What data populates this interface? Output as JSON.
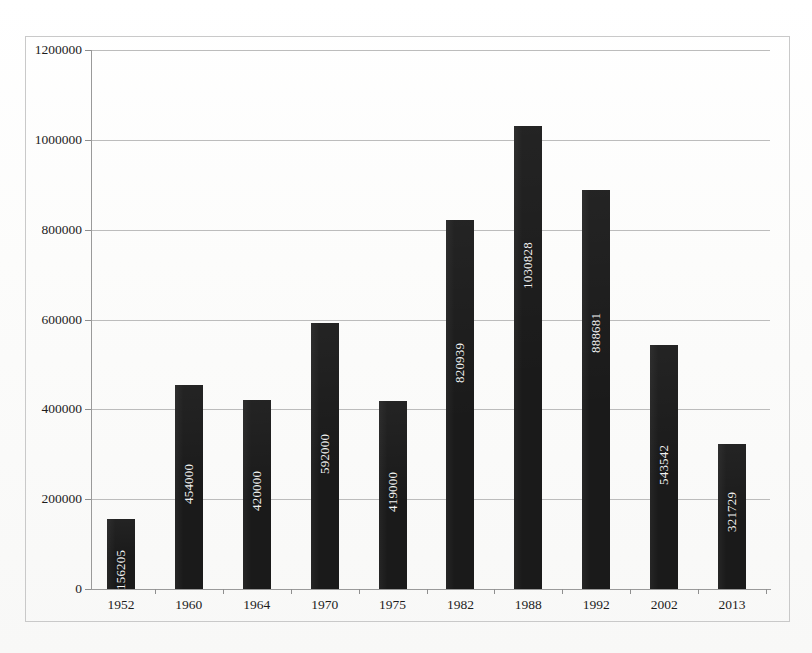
{
  "chart_data": {
    "type": "bar",
    "title": "",
    "subtitle": "",
    "xlabel": "",
    "ylabel": "",
    "categories": [
      "1952",
      "1960",
      "1964",
      "1970",
      "1975",
      "1982",
      "1988",
      "1992",
      "2002",
      "2013"
    ],
    "values": [
      156205,
      454000,
      420000,
      592000,
      419000,
      820939,
      1030828,
      888681,
      543542,
      321729
    ],
    "value_labels": [
      "156205",
      "454000",
      "420000",
      "592000",
      "419000",
      "820939",
      "1030828",
      "888681",
      "543542",
      "321729"
    ],
    "ylim": [
      0,
      1200000
    ],
    "yticks": [
      0,
      200000,
      400000,
      600000,
      800000,
      1000000,
      1200000
    ],
    "ytick_labels": [
      "0",
      "200000",
      "400000",
      "600000",
      "800000",
      "1000000",
      "1200000"
    ],
    "grid": true,
    "legend": false,
    "legend_position": "none",
    "bar_color": "#1a1a1a",
    "value_label_color": "#f2f2f2",
    "value_label_rotation": -90,
    "gridline_color": "#bcbcbc",
    "axis_color": "#9a9a9a",
    "background_color": "#fdfdfc"
  }
}
